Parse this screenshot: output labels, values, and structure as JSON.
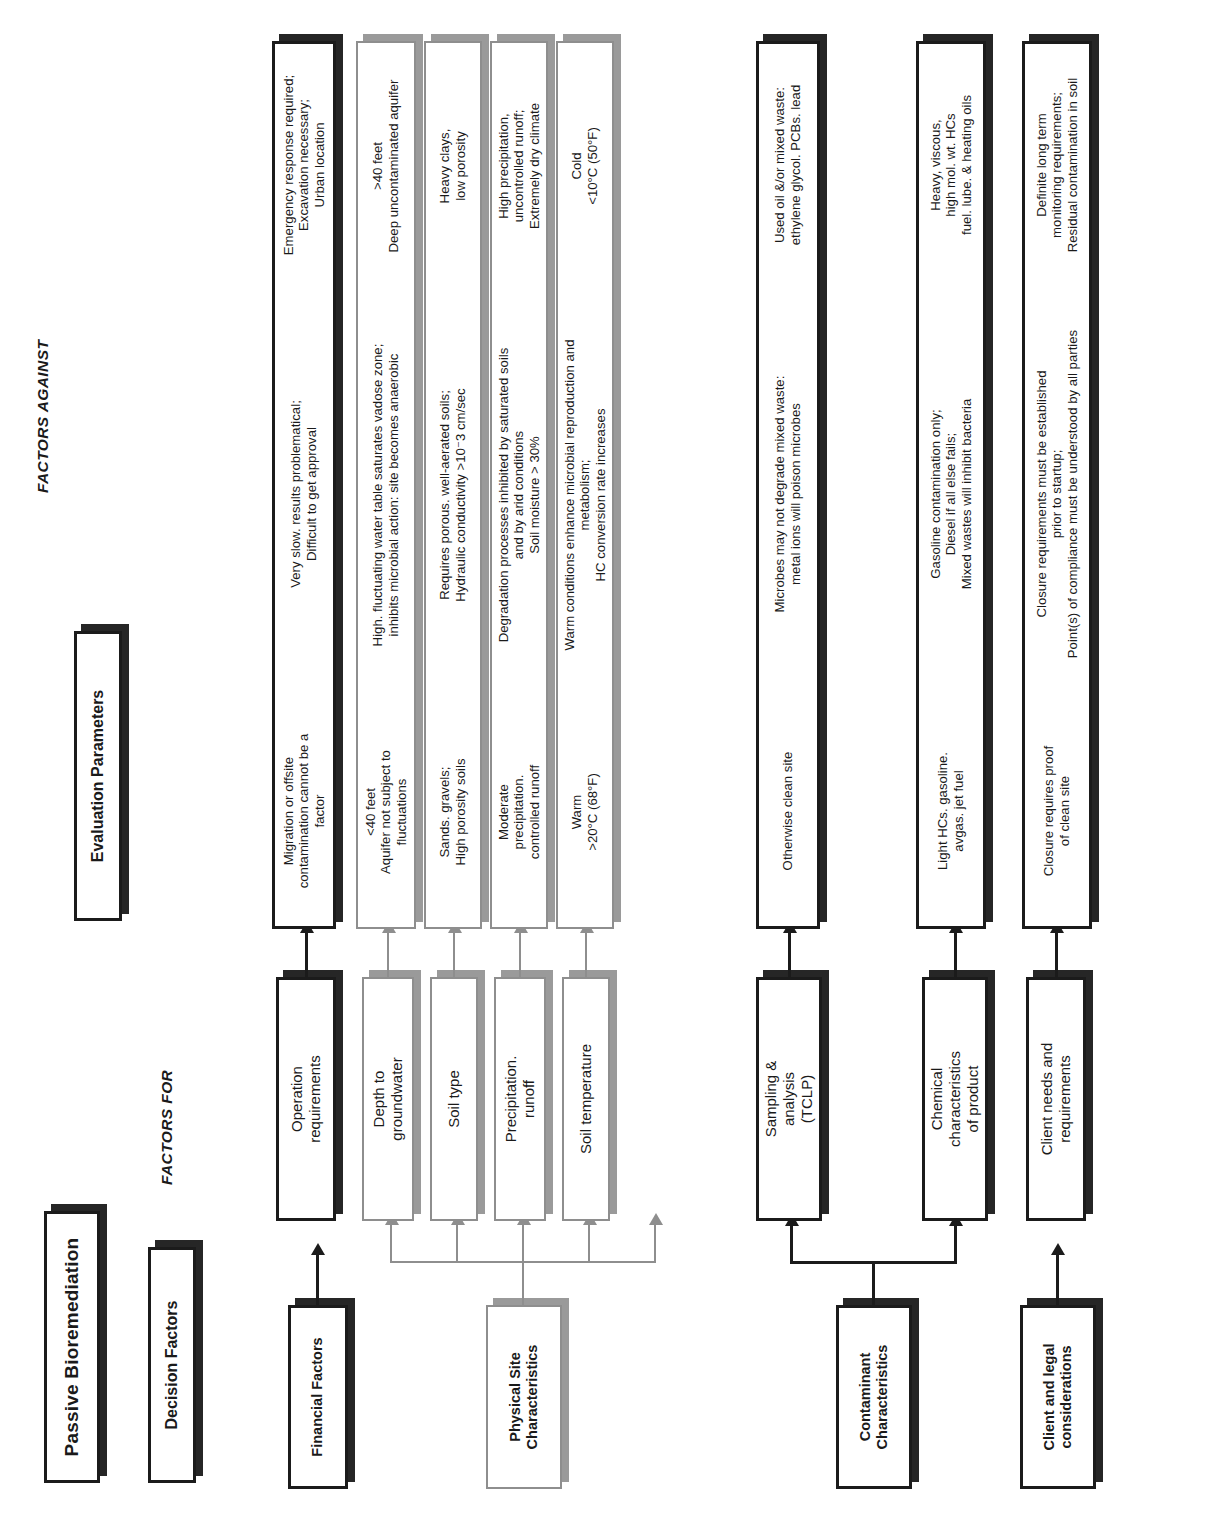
{
  "title": "Passive Bioremediation",
  "headers": {
    "decision_factors": "Decision Factors",
    "evaluation_parameters": "Evaluation Parameters",
    "factors_for": "FACTORS FOR",
    "factors_against": "FACTORS AGAINST"
  },
  "colors": {
    "ink": "#1b1b1b",
    "shadow_dark": "#262626",
    "shadow_gray": "#9a9a9a",
    "outline_gray": "#8e8e8e",
    "paper": "#ffffff"
  },
  "categories": [
    {
      "id": "financial",
      "label": "Financial Factors",
      "style": "dark"
    },
    {
      "id": "physical",
      "label": "Physical Site\nCharacteristics",
      "style": "gray"
    },
    {
      "id": "contaminant",
      "label": "Contaminant\nCharacteristics",
      "style": "dark"
    },
    {
      "id": "client",
      "label": "Client and legal\nconsiderations",
      "style": "dark"
    }
  ],
  "rows": [
    {
      "id": "operation-requirements",
      "category": "financial",
      "style": "dark",
      "decision_factor": "Operation\nrequirements",
      "evaluation_parameter": "Very slow. results problematical;\nDifficult to get approval",
      "factor_for": "Migration or offsite\ncontamination cannot be a\nfactor",
      "factor_against": "Emergency response required;\nExcavation necessary;\nUrban location"
    },
    {
      "id": "depth-to-groundwater",
      "category": "physical",
      "style": "gray",
      "decision_factor": "Depth to\ngroundwater",
      "evaluation_parameter": "High. fluctuating water table saturates vadose zone;\ninhibits microbial action: site becomes anaerobic",
      "factor_for": "<40 feet\nAquifer not subject to\nfluctuations",
      "factor_against": ">40 feet\nDeep uncontaminated aquifer"
    },
    {
      "id": "soil-type",
      "category": "physical",
      "style": "gray",
      "decision_factor": "Soil type",
      "evaluation_parameter": "Requires porous. well-aerated soils;\nHydraulic conductivity >10⁻3 cm/sec",
      "factor_for": "Sands. gravels;\nHigh porosity soils",
      "factor_against": "Heavy clays,\nlow porosity"
    },
    {
      "id": "precipitation-runoff",
      "category": "physical",
      "style": "gray",
      "decision_factor": "Precipitation.\nrunoff",
      "evaluation_parameter": "Degradation processes inhibited by saturated soils\nand by arid conditions\nSoil moisture > 30%",
      "factor_for": "Moderate\nprecipitation.\ncontrolled runoff",
      "factor_against": "High precipitation,\nuncontrolled runoff;\nExtremely dry climate"
    },
    {
      "id": "soil-temperature",
      "category": "physical",
      "style": "gray",
      "decision_factor": "Soil temperature",
      "evaluation_parameter": "Warm conditions enhance microbial reproduction and\nmetabolism;\nHC conversion rate increases",
      "factor_for": "Warm\n>20°C (68°F)",
      "factor_against": "Cold\n<10°C (50°F)"
    },
    {
      "id": "sampling-analysis",
      "category": "contaminant",
      "style": "dark",
      "decision_factor": "Sampling &\nanalysis\n(TCLP)",
      "evaluation_parameter": "Microbes may not degrade mixed waste:\nmetal ions will poison microbes",
      "factor_for": "Otherwise clean site",
      "factor_against": "Used oil &/or mixed waste:\nethylene glycol. PCBs. lead"
    },
    {
      "id": "chemical-characteristics",
      "category": "contaminant",
      "style": "dark",
      "decision_factor": "Chemical\ncharacteristics\nof product",
      "evaluation_parameter": "Gasoline contamination only;\nDiesel if all else fails;\nMixed wastes will inhibit bacteria",
      "factor_for": "Light HCs. gasoline.\navgas. jet fuel",
      "factor_against": "Heavy, viscous,\nhigh mol. wt. HCs\nfuel. lube. & heating oils"
    },
    {
      "id": "client-needs",
      "category": "client",
      "style": "dark",
      "decision_factor": "Client needs and\nrequirements",
      "evaluation_parameter": "Closure requirements must be established\nprior to startup;\nPoint(s) of compliance must be understood by all parties",
      "factor_for": "Closure requires proof\nof clean site",
      "factor_against": "Definite long term\nmonitoring requirements;\nResidual contamination in soil"
    }
  ]
}
